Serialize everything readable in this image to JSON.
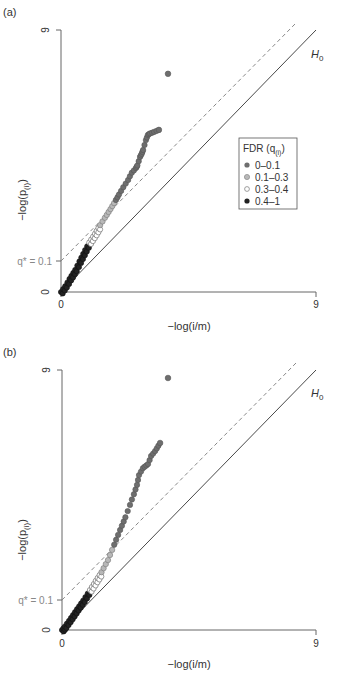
{
  "chart_data": [
    {
      "type": "scatter",
      "panel_label": "(a)",
      "xlabel": "−log(i/m)",
      "ylabel": "−log(p(i))",
      "xlim": [
        0,
        9
      ],
      "ylim": [
        0,
        9
      ],
      "xticks": [
        "0",
        "9"
      ],
      "yticks": [
        "0",
        "9"
      ],
      "q_label": "q* = 0.1",
      "q_intercept": 1.05,
      "reference_line_label": "H0",
      "legend": {
        "title": "FDR (q(i))",
        "position": "right",
        "entries": [
          {
            "label": "0–0.1",
            "color": "#6e6e6e",
            "fill": "#6e6e6e"
          },
          {
            "label": "0.1–0.3",
            "color": "#8a8a8a",
            "fill": "#b8b8b8"
          },
          {
            "label": "0.3–0.4",
            "color": "#777777",
            "fill": "#ffffff"
          },
          {
            "label": "0.4–1",
            "color": "#222222",
            "fill": "#222222"
          }
        ]
      },
      "points": [
        {
          "x": 3.78,
          "y": 7.5,
          "group": 0
        },
        {
          "x": 3.46,
          "y": 5.57,
          "group": 0
        },
        {
          "x": 3.29,
          "y": 5.5,
          "group": 0
        },
        {
          "x": 3.15,
          "y": 5.45,
          "group": 0
        },
        {
          "x": 3.07,
          "y": 5.4,
          "group": 0
        },
        {
          "x": 3.0,
          "y": 5.22,
          "group": 0
        },
        {
          "x": 2.9,
          "y": 4.88,
          "group": 0
        },
        {
          "x": 2.85,
          "y": 4.75,
          "group": 0
        },
        {
          "x": 2.79,
          "y": 4.64,
          "group": 0
        },
        {
          "x": 2.7,
          "y": 4.35,
          "group": 0
        },
        {
          "x": 2.65,
          "y": 4.26,
          "group": 0
        },
        {
          "x": 2.5,
          "y": 4.1,
          "group": 0
        },
        {
          "x": 2.37,
          "y": 3.85,
          "group": 0
        },
        {
          "x": 2.2,
          "y": 3.6,
          "group": 0
        },
        {
          "x": 2.05,
          "y": 3.35,
          "group": 0
        },
        {
          "x": 1.94,
          "y": 3.16,
          "group": 1
        },
        {
          "x": 1.75,
          "y": 2.85,
          "group": 1
        },
        {
          "x": 1.55,
          "y": 2.55,
          "group": 1
        },
        {
          "x": 1.38,
          "y": 2.3,
          "group": 2
        },
        {
          "x": 1.2,
          "y": 2.0,
          "group": 2
        },
        {
          "x": 1.0,
          "y": 1.7,
          "group": 3
        },
        {
          "x": 0.85,
          "y": 1.44,
          "group": 3
        },
        {
          "x": 0.65,
          "y": 1.05,
          "group": 3
        },
        {
          "x": 0.5,
          "y": 0.76,
          "group": 3
        },
        {
          "x": 0.3,
          "y": 0.45,
          "group": 3
        },
        {
          "x": 0.15,
          "y": 0.2,
          "group": 3
        },
        {
          "x": 0.0,
          "y": 0.0,
          "group": 3
        }
      ]
    },
    {
      "type": "scatter",
      "panel_label": "(b)",
      "xlabel": "−log(i/m)",
      "ylabel": "−log(p(i))",
      "xlim": [
        0,
        9
      ],
      "ylim": [
        0,
        9
      ],
      "xticks": [
        "0",
        "9"
      ],
      "yticks": [
        "0",
        "9"
      ],
      "q_label": "q* = 0.1",
      "q_intercept": 1.05,
      "reference_line_label": "H0",
      "points": [
        {
          "x": 3.76,
          "y": 8.72,
          "group": 0
        },
        {
          "x": 3.48,
          "y": 6.47,
          "group": 0
        },
        {
          "x": 3.3,
          "y": 6.19,
          "group": 0
        },
        {
          "x": 3.16,
          "y": 6.02,
          "group": 0
        },
        {
          "x": 3.05,
          "y": 5.74,
          "group": 0
        },
        {
          "x": 2.87,
          "y": 5.6,
          "group": 0
        },
        {
          "x": 2.73,
          "y": 5.36,
          "group": 0
        },
        {
          "x": 2.66,
          "y": 5.02,
          "group": 0
        },
        {
          "x": 2.55,
          "y": 4.7,
          "group": 0
        },
        {
          "x": 2.41,
          "y": 4.33,
          "group": 0
        },
        {
          "x": 2.25,
          "y": 3.9,
          "group": 0
        },
        {
          "x": 2.06,
          "y": 3.46,
          "group": 0
        },
        {
          "x": 1.85,
          "y": 2.95,
          "group": 1
        },
        {
          "x": 1.63,
          "y": 2.42,
          "group": 1
        },
        {
          "x": 1.4,
          "y": 2.0,
          "group": 2
        },
        {
          "x": 1.2,
          "y": 1.7,
          "group": 2
        },
        {
          "x": 0.99,
          "y": 1.38,
          "group": 3
        },
        {
          "x": 0.75,
          "y": 1.02,
          "group": 3
        },
        {
          "x": 0.46,
          "y": 0.62,
          "group": 3
        },
        {
          "x": 0.25,
          "y": 0.32,
          "group": 3
        },
        {
          "x": 0.1,
          "y": 0.12,
          "group": 3
        },
        {
          "x": 0.0,
          "y": 0.0,
          "group": 3
        }
      ]
    }
  ],
  "panels": {
    "a": {
      "label": "(a)",
      "xlabel": "−log(i/m)",
      "ylabel": "−log(p",
      "ylabel_sub": "(i)",
      "ylabel_end": ")",
      "x0": "0",
      "x9": "9",
      "y0": "0",
      "y9": "9",
      "q_label": "q* = 0.1",
      "h0": "H",
      "h0_sub": "0"
    },
    "b": {
      "label": "(b)",
      "xlabel": "−log(i/m)",
      "ylabel": "−log(p",
      "ylabel_sub": "(i)",
      "ylabel_end": ")",
      "x0": "0",
      "x9": "9",
      "y0": "0",
      "y9": "9",
      "q_label": "q* = 0.1",
      "h0": "H",
      "h0_sub": "0"
    }
  },
  "legend": {
    "title": "FDR (q",
    "title_sub": "(i)",
    "title_end": ")",
    "entries": [
      "0–0.1",
      "0.1–0.3",
      "0.3–0.4",
      "0.4–1"
    ]
  }
}
